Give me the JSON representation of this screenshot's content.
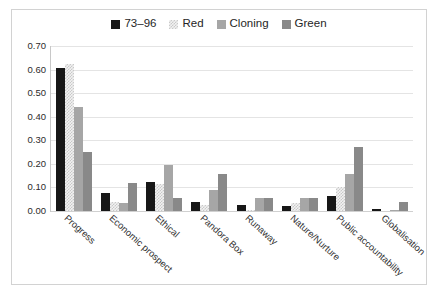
{
  "chart_data": {
    "type": "bar",
    "title": "",
    "subtitle": "",
    "xlabel": "",
    "ylabel": "",
    "ylim": [
      0.0,
      0.7
    ],
    "ytick_labels": [
      "0.70",
      "0.60",
      "0.50",
      "0.40",
      "0.30",
      "0.20",
      "0.10",
      "0.00"
    ],
    "ytick_values": [
      0.7,
      0.6,
      0.5,
      0.4,
      0.3,
      0.2,
      0.1,
      0.0
    ],
    "grid": true,
    "legend_position": "top-center",
    "orientation": "vertical",
    "grouping": "clustered",
    "categories": [
      "Progress",
      "Economic prospect",
      "Ethical",
      "Pandora Box",
      "Runaway",
      "Nature/Nurture",
      "Public accountability",
      "Globalisation"
    ],
    "series": [
      {
        "name": "73–96",
        "color": "#171717",
        "pattern": "solid",
        "values": [
          0.605,
          0.075,
          0.125,
          0.04,
          0.025,
          0.02,
          0.065,
          0.01
        ]
      },
      {
        "name": "Red",
        "color": "#f2f2f2",
        "pattern": "dotted",
        "values": [
          0.625,
          0.04,
          0.115,
          0.025,
          0.005,
          0.035,
          0.1,
          0.0
        ]
      },
      {
        "name": "Cloning",
        "color": "#a6a6a6",
        "pattern": "solid",
        "values": [
          0.44,
          0.035,
          0.195,
          0.09,
          0.055,
          0.055,
          0.155,
          0.005
        ]
      },
      {
        "name": "Green",
        "color": "#898989",
        "pattern": "solid",
        "values": [
          0.25,
          0.12,
          0.055,
          0.155,
          0.055,
          0.055,
          0.27,
          0.04
        ]
      }
    ]
  }
}
